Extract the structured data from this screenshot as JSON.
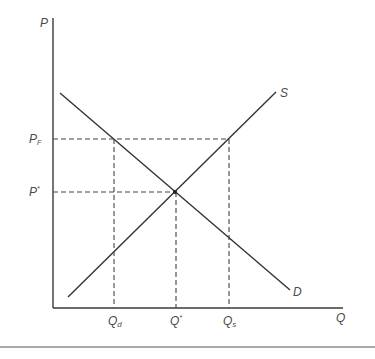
{
  "diagram": {
    "type": "supply-demand",
    "axes": {
      "y_label": "P",
      "x_label": "Q"
    },
    "curves": {
      "supply_label": "S",
      "demand_label": "D"
    },
    "price_labels": {
      "floor_main": "P",
      "floor_sub": "F",
      "equilibrium_main": "P",
      "equilibrium_sup": "*"
    },
    "quantity_labels": {
      "demanded_main": "Q",
      "demanded_sub": "d",
      "equilibrium_main": "Q",
      "equilibrium_sup": "*",
      "supplied_main": "Q",
      "supplied_sub": "s"
    },
    "colors": {
      "line": "#333333",
      "text": "#4a4a4a",
      "background": "#ffffff"
    }
  }
}
